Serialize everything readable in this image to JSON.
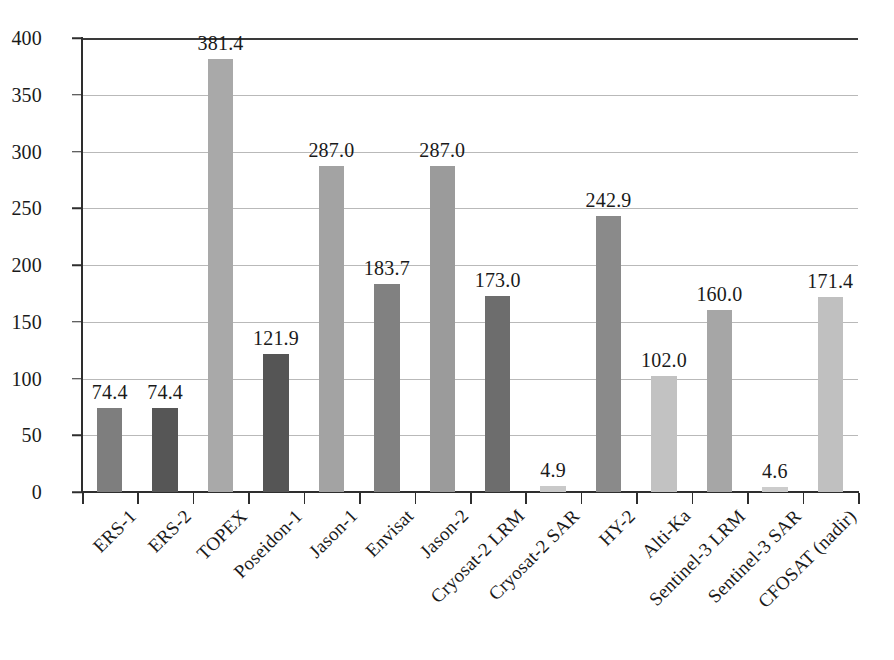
{
  "chart_data": {
    "type": "bar",
    "title": "",
    "subtitle": "",
    "xlabel": "",
    "ylabel": "",
    "ylim": [
      0,
      400
    ],
    "ytick_values": [
      0,
      50,
      100,
      150,
      200,
      250,
      300,
      350,
      400
    ],
    "ytick_labels": [
      "0",
      "50",
      "100",
      "150",
      "200",
      "250",
      "300",
      "350",
      "400"
    ],
    "grid": "horizontal",
    "legend": "none",
    "categories": [
      "ERS-1",
      "ERS-2",
      "TOPEX",
      "Poseidon-1",
      "Jason-1",
      "Envisat",
      "Jason-2",
      "Cryosat-2 LRM",
      "Cryosat-2 SAR",
      "HY-2",
      "Alti-Ka",
      "Sentinel-3 LRM",
      "Sentinel-3 SAR",
      "CFOSAT (nadir)"
    ],
    "values": [
      74.4,
      74.4,
      381.4,
      121.9,
      287.0,
      183.7,
      287.0,
      173.0,
      4.9,
      242.9,
      102.0,
      160.0,
      4.6,
      171.4
    ],
    "value_labels": [
      "74.4",
      "74.4",
      "381.4",
      "121.9",
      "287.0",
      "183.7",
      "287.0",
      "173.0",
      "4.9",
      "242.9",
      "102.0",
      "160.0",
      "4.6",
      "171.4"
    ],
    "bar_colors": [
      "#7e7e7e",
      "#565656",
      "#a9a9a9",
      "#555555",
      "#a3a3a3",
      "#818181",
      "#9b9b9b",
      "#6d6d6d",
      "#c9c9c9",
      "#8a8a8a",
      "#c2c2c2",
      "#a6a6a6",
      "#cccccc",
      "#c0c0c0"
    ],
    "axis_color": "#2e2e2e",
    "gridline_color": "#b9b9b9",
    "top_rule_color": "#3a3a3a",
    "background_color": "#ffffff",
    "text_color": "#1a1a1a"
  }
}
